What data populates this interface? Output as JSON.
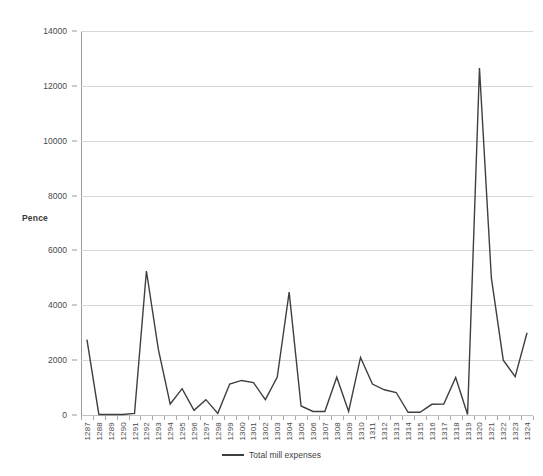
{
  "chart_data": {
    "type": "line",
    "title": "",
    "xlabel": "",
    "ylabel": "Pence",
    "ylim": [
      0,
      14000
    ],
    "ytick_step": 2000,
    "yticks": [
      0,
      2000,
      4000,
      6000,
      8000,
      10000,
      12000,
      14000
    ],
    "grid": true,
    "legend_position": "bottom-center",
    "line_color": "#3f3f3f",
    "grid_color": "#d6d6d6",
    "axis_color": "#9a9a9a",
    "categories": [
      "1287",
      "1288",
      "1289",
      "1290",
      "1291",
      "1292",
      "1293",
      "1294",
      "1295",
      "1296",
      "1297",
      "1298",
      "1299",
      "1300",
      "1301",
      "1302",
      "1303",
      "1304",
      "1305",
      "1306",
      "1307",
      "1308",
      "1309",
      "1310",
      "1311",
      "1312",
      "1313",
      "1314",
      "1315",
      "1316",
      "1317",
      "1318",
      "1319",
      "1320",
      "1321",
      "1322",
      "1323",
      "1324"
    ],
    "series": [
      {
        "name": "Total mill expenses",
        "values": [
          2750,
          20,
          20,
          20,
          60,
          5250,
          2400,
          400,
          960,
          170,
          560,
          60,
          1130,
          1260,
          1180,
          560,
          1380,
          4480,
          330,
          130,
          130,
          1380,
          130,
          2100,
          1130,
          920,
          820,
          100,
          100,
          390,
          400,
          1370,
          20,
          12650,
          5000,
          2000,
          1400,
          3000
        ]
      }
    ]
  },
  "legend": {
    "entries": [
      {
        "label": "Total mill expenses",
        "color": "#3f3f3f"
      }
    ]
  },
  "axis": {
    "y_title": "Pence"
  }
}
